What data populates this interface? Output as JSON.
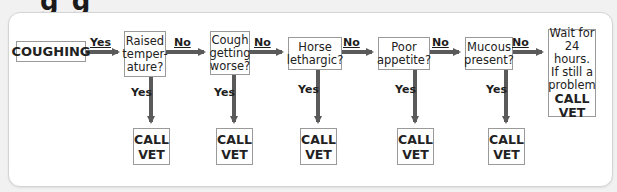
{
  "panel": {
    "background": "#ffffff",
    "border": "#d4d4d4"
  },
  "title_fragment": "g    g",
  "flow": {
    "start": {
      "label": "COUGHING"
    },
    "start_edge_label": "Yes",
    "questions": [
      {
        "label": "Raised\ntemper-\nature?",
        "no_label": "No",
        "yes_label": "Yes",
        "outcome": "CALL\nVET"
      },
      {
        "label": "Cough\ngetting\nworse?",
        "no_label": "No",
        "yes_label": "Yes",
        "outcome": "CALL\nVET"
      },
      {
        "label": "Horse\nlethargic?",
        "no_label": "No",
        "yes_label": "Yes",
        "outcome": "CALL\nVET"
      },
      {
        "label": "Poor\nappetite?",
        "no_label": "No",
        "yes_label": "Yes",
        "outcome": "CALL\nVET"
      },
      {
        "label": "Mucous\npresent?",
        "no_label": "No",
        "yes_label": "Yes",
        "outcome": "CALL\nVET"
      }
    ],
    "final": {
      "label": "Wait for\n24 hours.\nIf still a\nproblem",
      "action": "CALL\nVET"
    }
  },
  "colors": {
    "arrow": "#5a5a5a",
    "box_border": "#9a9a9a",
    "text": "#222222"
  }
}
